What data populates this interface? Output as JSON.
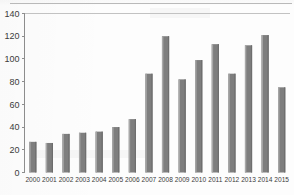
{
  "chart_data": {
    "type": "bar",
    "title": "",
    "xlabel": "",
    "ylabel": "",
    "categories": [
      "2000",
      "2001",
      "2002",
      "2003",
      "2004",
      "2005",
      "2006",
      "2007",
      "2008",
      "2009",
      "2010",
      "2011",
      "2012",
      "2013",
      "2014",
      "2015"
    ],
    "values": [
      27,
      26,
      34,
      35,
      36,
      40,
      47,
      87,
      120,
      82,
      99,
      113,
      87,
      112,
      121,
      75
    ],
    "series": [
      {
        "name": "",
        "values": [
          27,
          26,
          34,
          35,
          36,
          40,
          47,
          87,
          120,
          82,
          99,
          113,
          87,
          112,
          121,
          75
        ]
      }
    ],
    "ylim": [
      0,
      140
    ],
    "yticks": [
      0,
      20,
      40,
      60,
      80,
      100,
      120,
      140
    ],
    "ytick_labels": [
      "0",
      "20",
      "40",
      "60",
      "80",
      "100",
      "120",
      "140"
    ],
    "grid": false,
    "top_gridline_value": 140,
    "legend": [],
    "legend_position": "none",
    "bar_color": "#7e7e7e",
    "axis_color": "#8d8d8d",
    "text_color": "#3b3b3b",
    "background_color": "#ffffff"
  }
}
